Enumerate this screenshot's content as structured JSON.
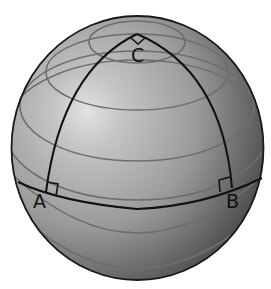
{
  "diagram": {
    "type": "spherical-triangle",
    "vertices": [
      {
        "id": "A",
        "label": "A"
      },
      {
        "id": "B",
        "label": "B"
      },
      {
        "id": "C",
        "label": "C"
      }
    ],
    "right_angle_markers": [
      "A",
      "B",
      "C"
    ],
    "colors": {
      "sphere_light": "#dcdcdc",
      "sphere_mid": "#a8a8a8",
      "sphere_dark": "#4a4a4a",
      "outline": "#1a1a1a",
      "latitude_lines": "#6e6e6e",
      "triangle_edges": "#111111"
    }
  }
}
